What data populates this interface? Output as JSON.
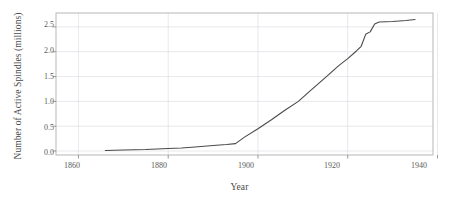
{
  "chart_data": {
    "type": "line",
    "title": "",
    "xlabel": "Year",
    "ylabel": "Number of Active Spindles (millions)",
    "xlim": [
      1855,
      1939
    ],
    "ylim": [
      -0.08,
      2.78
    ],
    "xticks": [
      1860,
      1880,
      1900,
      1920,
      1940
    ],
    "xtick_labels": [
      "1860",
      "1880",
      "1900",
      "1920",
      "1940"
    ],
    "yticks": [
      0.0,
      0.5,
      1.0,
      1.5,
      2.0,
      2.5
    ],
    "ytick_labels": [
      "0.0",
      "0.5",
      "1.0",
      "1.5",
      "2.0",
      "2.5"
    ],
    "grid": true,
    "grid_color": "#d8d8e0",
    "legend": "none",
    "line_color": "#4a4a4a",
    "line_width": 1.1,
    "frame_color": "#b0b0b0",
    "background": "#ffffff",
    "series": [
      {
        "name": "Active Spindles",
        "x": [
          1866,
          1870,
          1875,
          1880,
          1883,
          1886,
          1890,
          1893,
          1895,
          1897,
          1900,
          1903,
          1906,
          1909,
          1912,
          1915,
          1918,
          1920,
          1922,
          1923,
          1924,
          1925,
          1926,
          1927,
          1930,
          1933,
          1935
        ],
        "y": [
          0.01,
          0.02,
          0.03,
          0.05,
          0.06,
          0.08,
          0.11,
          0.13,
          0.15,
          0.28,
          0.45,
          0.63,
          0.82,
          1.0,
          1.24,
          1.48,
          1.72,
          1.86,
          2.02,
          2.11,
          2.35,
          2.4,
          2.56,
          2.6,
          2.61,
          2.63,
          2.65
        ]
      }
    ]
  }
}
